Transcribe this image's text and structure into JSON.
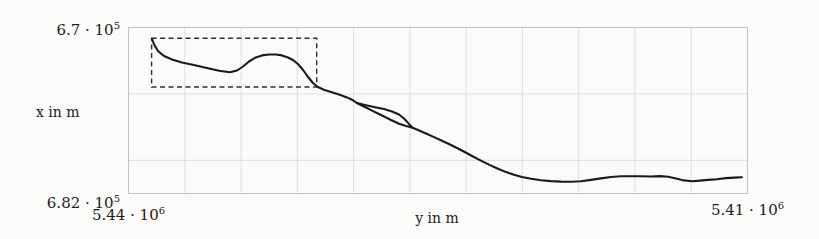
{
  "chart_data": {
    "type": "line",
    "title": "",
    "xlabel": "y in m",
    "ylabel": "x in m",
    "grid": "on",
    "x_axis": {
      "label_left": {
        "base": "5.44 · 10",
        "exp": "6"
      },
      "label_right": {
        "base": "5.41 · 10",
        "exp": "6"
      },
      "range": [
        5440000,
        5410000
      ],
      "direction": "values decrease to the right"
    },
    "y_axis": {
      "label_top": {
        "base": "6.7 · 10",
        "exp": "5"
      },
      "label_bottom": {
        "base": "6.82 · 10",
        "exp": "5"
      },
      "range": [
        670000,
        682000
      ],
      "direction": "values increase downward"
    },
    "annotations": [
      {
        "type": "dashed-rect",
        "note": "highlight box around first track segment",
        "y_range": [
          5438880,
          5430880
        ],
        "x_range": [
          670780,
          674300
        ]
      }
    ],
    "series": [
      {
        "name": "track-main",
        "points": [
          [
            5438860,
            670830
          ],
          [
            5438760,
            671230
          ],
          [
            5438570,
            671700
          ],
          [
            5438280,
            672060
          ],
          [
            5437890,
            672310
          ],
          [
            5437410,
            672530
          ],
          [
            5436830,
            672710
          ],
          [
            5436200,
            672930
          ],
          [
            5435610,
            673120
          ],
          [
            5435080,
            673230
          ],
          [
            5434740,
            673110
          ],
          [
            5434450,
            672820
          ],
          [
            5434160,
            672460
          ],
          [
            5433870,
            672190
          ],
          [
            5433530,
            672020
          ],
          [
            5433190,
            671950
          ],
          [
            5432850,
            671950
          ],
          [
            5432560,
            672020
          ],
          [
            5432270,
            672170
          ],
          [
            5432030,
            672350
          ],
          [
            5431790,
            672640
          ],
          [
            5431540,
            673070
          ],
          [
            5431300,
            673580
          ],
          [
            5431060,
            674010
          ],
          [
            5430820,
            674300
          ],
          [
            5430530,
            674500
          ],
          [
            5430190,
            674660
          ],
          [
            5429800,
            674840
          ],
          [
            5429410,
            675050
          ],
          [
            5429120,
            675260
          ],
          [
            5428930,
            675460
          ],
          [
            5428540,
            675750
          ],
          [
            5428150,
            676040
          ],
          [
            5427710,
            676360
          ],
          [
            5427280,
            676690
          ],
          [
            5426890,
            676960
          ],
          [
            5426550,
            677130
          ],
          [
            5426260,
            677230
          ],
          [
            5425970,
            677410
          ],
          [
            5425580,
            677660
          ],
          [
            5425190,
            677920
          ],
          [
            5424810,
            678180
          ],
          [
            5424420,
            678460
          ],
          [
            5424030,
            678750
          ],
          [
            5423640,
            679060
          ],
          [
            5423260,
            679360
          ],
          [
            5422870,
            679660
          ],
          [
            5422480,
            679950
          ],
          [
            5422090,
            680210
          ],
          [
            5421700,
            680450
          ],
          [
            5421320,
            680650
          ],
          [
            5420930,
            680810
          ],
          [
            5420490,
            680940
          ],
          [
            5420010,
            681040
          ],
          [
            5419520,
            681100
          ],
          [
            5419040,
            681140
          ],
          [
            5418550,
            681150
          ],
          [
            5418070,
            681120
          ],
          [
            5417580,
            681020
          ],
          [
            5417100,
            680910
          ],
          [
            5416610,
            680810
          ],
          [
            5416130,
            680750
          ],
          [
            5415650,
            680750
          ],
          [
            5415160,
            680760
          ],
          [
            5414680,
            680770
          ],
          [
            5414240,
            680740
          ],
          [
            5413850,
            680790
          ],
          [
            5413460,
            680920
          ],
          [
            5413080,
            681050
          ],
          [
            5412690,
            681110
          ],
          [
            5412300,
            681070
          ],
          [
            5411910,
            681020
          ],
          [
            5411480,
            680970
          ],
          [
            5411040,
            680890
          ],
          [
            5410650,
            680850
          ],
          [
            5410270,
            680830
          ]
        ]
      },
      {
        "name": "track-branch",
        "points": [
          [
            5428930,
            675460
          ],
          [
            5428540,
            675600
          ],
          [
            5428100,
            675750
          ],
          [
            5427620,
            675890
          ],
          [
            5427230,
            676070
          ],
          [
            5426890,
            676290
          ],
          [
            5426650,
            676580
          ],
          [
            5426450,
            676900
          ],
          [
            5426260,
            677230
          ]
        ]
      }
    ],
    "layout": {
      "plot_area_px": {
        "left": 128.5,
        "top": 27.5,
        "right": 747.5,
        "bottom": 193.5
      },
      "v_gridline_values": [
        5440000,
        5437273,
        5434545,
        5431818,
        5429091,
        5426364,
        5423636,
        5420909,
        5418182,
        5415455,
        5412727,
        5410000
      ],
      "h_gridline_values": [
        670000,
        674800,
        679600
      ],
      "colors": {
        "background": "#fbfbfa",
        "grid": "#dedede",
        "frame": "#c2c2c2",
        "curve": "#1a1a1a",
        "dash": "#2e2e2e"
      }
    }
  }
}
